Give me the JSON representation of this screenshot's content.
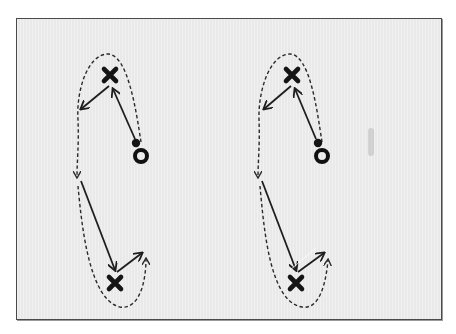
{
  "diagram": {
    "type": "drill-play-diagram",
    "colors": {
      "background": "#e9e9e9",
      "ink": "#1e1e1e",
      "border": "#4a4a4a"
    },
    "panels": [
      {
        "name": "left-drill",
        "players": [
          {
            "symbol": "X",
            "role": "defender-top",
            "x": 110,
            "y": 75
          },
          {
            "symbol": "X",
            "role": "defender-bottom",
            "x": 115,
            "y": 283
          },
          {
            "symbol": "O",
            "role": "attacker",
            "x": 138,
            "y": 157
          }
        ],
        "ball": {
          "x": 136,
          "y": 143
        }
      },
      {
        "name": "right-drill",
        "players": [
          {
            "symbol": "X",
            "role": "defender-top",
            "x": 292,
            "y": 75
          },
          {
            "symbol": "X",
            "role": "defender-bottom",
            "x": 296,
            "y": 283
          },
          {
            "symbol": "O",
            "role": "attacker",
            "x": 318,
            "y": 157
          }
        ],
        "ball": {
          "x": 316,
          "y": 143
        }
      }
    ],
    "legend": {
      "solid_arrow": "pass / player movement",
      "dashed_arrow": "run / dribble path"
    }
  }
}
